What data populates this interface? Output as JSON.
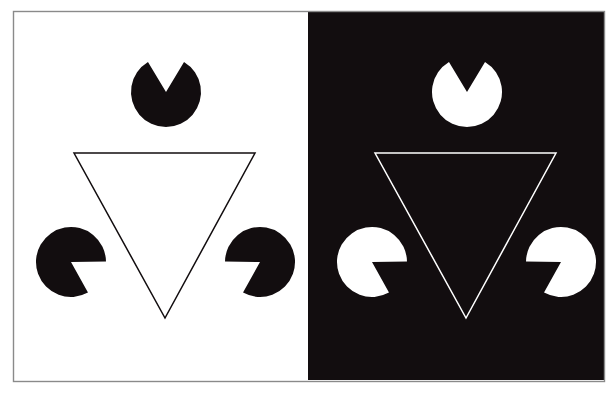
{
  "figure": {
    "canvas": {
      "width": 616,
      "height": 395,
      "background": "#ffffff"
    },
    "colors": {
      "white": "#ffffff",
      "black": "#120d0f",
      "frame_line": "#8a8a8a",
      "outline_dark": "#1a1a1a",
      "outline_light": "#ffffff"
    },
    "frame": {
      "name": "outer-frame",
      "x": 13,
      "y": 11,
      "width": 591,
      "height": 370,
      "stroke_width": 1.4
    },
    "panels": [
      {
        "id": "left-panel",
        "label": "light panel",
        "background": "#ffffff",
        "ink": "#120d0f",
        "x": 14,
        "y": 12,
        "width": 294,
        "height": 368,
        "inducer_radius": 35,
        "wedge_span_deg": 62,
        "outline_triangle": {
          "label": "outlined point-down triangle",
          "stroke_width": 1.5,
          "points": [
            [
              74,
              153
            ],
            [
              255,
              153
            ],
            [
              165,
              318
            ]
          ]
        },
        "illusory_triangle": {
          "label": "illusory point-up triangle",
          "points": [
            [
              166,
              92
            ],
            [
              71,
              262
            ],
            [
              260,
              262
            ]
          ]
        },
        "inducers": [
          {
            "name": "inducer-disc-top",
            "cx": 166,
            "cy": 92,
            "r": 35,
            "wedge_bisector_deg": 90,
            "wedge_opens": "down"
          },
          {
            "name": "inducer-disc-bottom-left",
            "cx": 71,
            "cy": 262,
            "r": 35,
            "wedge_bisector_deg": 330,
            "wedge_opens": "upper-right"
          },
          {
            "name": "inducer-disc-bottom-right",
            "cx": 260,
            "cy": 262,
            "r": 35,
            "wedge_bisector_deg": 210,
            "wedge_opens": "upper-left"
          }
        ]
      },
      {
        "id": "right-panel",
        "label": "dark panel",
        "background": "#120d0f",
        "ink": "#ffffff",
        "x": 308,
        "y": 12,
        "width": 296,
        "height": 368,
        "inducer_radius": 35,
        "wedge_span_deg": 62,
        "outline_triangle": {
          "label": "outlined point-down triangle",
          "stroke_width": 1.5,
          "points": [
            [
              375,
              153
            ],
            [
              556,
              153
            ],
            [
              466,
              318
            ]
          ]
        },
        "illusory_triangle": {
          "label": "illusory point-up triangle",
          "points": [
            [
              467,
              92
            ],
            [
              372,
              262
            ],
            [
              561,
              262
            ]
          ]
        },
        "inducers": [
          {
            "name": "inducer-disc-top",
            "cx": 467,
            "cy": 92,
            "r": 35,
            "wedge_bisector_deg": 90,
            "wedge_opens": "down"
          },
          {
            "name": "inducer-disc-bottom-left",
            "cx": 372,
            "cy": 262,
            "r": 35,
            "wedge_bisector_deg": 330,
            "wedge_opens": "upper-right"
          },
          {
            "name": "inducer-disc-bottom-right",
            "cx": 561,
            "cy": 262,
            "r": 35,
            "wedge_bisector_deg": 210,
            "wedge_opens": "upper-left"
          }
        ]
      }
    ]
  }
}
